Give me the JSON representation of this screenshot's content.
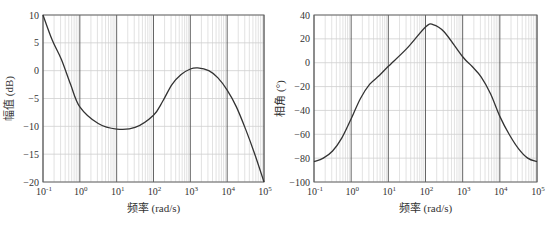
{
  "chart_data": [
    {
      "type": "line",
      "title": "",
      "xlabel": "频率 (rad/s)",
      "ylabel": "幅值 (dB)",
      "xscale": "log",
      "xlim": [
        0.1,
        100000
      ],
      "ylim": [
        -20,
        10
      ],
      "grid": true,
      "x_ticks": [
        "10^-1",
        "10^0",
        "10^1",
        "10^2",
        "10^3",
        "10^4",
        "10^5"
      ],
      "y_ticks": [
        10,
        5,
        0,
        -5,
        -10,
        -15,
        -20
      ],
      "series": [
        {
          "name": "magnitude",
          "log10_x": [
            -1,
            -0.75,
            -0.5,
            -0.25,
            0,
            0.5,
            1,
            1.5,
            2,
            2.25,
            2.5,
            2.75,
            3,
            3.2,
            3.5,
            3.75,
            4,
            4.25,
            4.5,
            4.75,
            5
          ],
          "values": [
            10,
            5.5,
            2,
            -2.5,
            -6.5,
            -9.5,
            -10.5,
            -10.2,
            -8,
            -5.5,
            -2.5,
            -0.7,
            0.3,
            0.5,
            0,
            -1.3,
            -3.5,
            -6.5,
            -10.5,
            -15,
            -20
          ]
        }
      ]
    },
    {
      "type": "line",
      "title": "",
      "xlabel": "频率 (rad/s)",
      "ylabel": "相角 (°)",
      "xscale": "log",
      "xlim": [
        0.1,
        100000
      ],
      "ylim": [
        -100,
        40
      ],
      "grid": true,
      "x_ticks": [
        "10^-1",
        "10^0",
        "10^1",
        "10^2",
        "10^3",
        "10^4",
        "10^5"
      ],
      "y_ticks": [
        40,
        20,
        0,
        -20,
        -40,
        -60,
        -80,
        -100
      ],
      "series": [
        {
          "name": "phase",
          "log10_x": [
            -1,
            -0.75,
            -0.5,
            -0.25,
            0,
            0.25,
            0.5,
            0.75,
            1,
            1.5,
            2,
            2.2,
            2.5,
            3,
            3.25,
            3.5,
            3.75,
            4,
            4.25,
            4.5,
            4.75,
            5
          ],
          "values": [
            -83,
            -80,
            -74,
            -63,
            -47,
            -30,
            -18,
            -11,
            -3,
            12,
            30,
            32,
            26,
            5,
            -3,
            -12,
            -26,
            -45,
            -60,
            -72,
            -80,
            -83
          ]
        }
      ]
    }
  ],
  "plots": {
    "left": {
      "ylabel": "幅值 (dB)",
      "xlabel": "频率 (rad/s)"
    },
    "right": {
      "ylabel": "相角 (°)",
      "xlabel": "频率 (rad/s)"
    }
  },
  "colors": {
    "curve": "#333333",
    "major_grid": "#555555",
    "minor_grid": "#cfcfcf",
    "frame": "#666666"
  }
}
